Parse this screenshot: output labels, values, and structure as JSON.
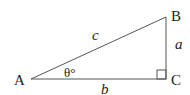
{
  "diagram": {
    "type": "right-triangle",
    "vertices": {
      "A": "A",
      "B": "B",
      "C": "C"
    },
    "sides": {
      "hypotenuse": "c",
      "opposite": "a",
      "adjacent": "b"
    },
    "angle_label": "θ°",
    "right_angle_at": "C",
    "stroke_color": "#555555"
  }
}
